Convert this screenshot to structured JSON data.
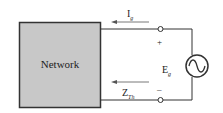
{
  "diagram": {
    "network_label": "Network",
    "current_label": "I",
    "current_sub": "g",
    "source_label": "E",
    "source_sub": "g",
    "impedance_label": "Z",
    "impedance_sub": "Th",
    "plus_sign": "+",
    "minus_sign": "–",
    "colors": {
      "box_fill": "#c8c8c8",
      "stroke": "#333333"
    }
  }
}
